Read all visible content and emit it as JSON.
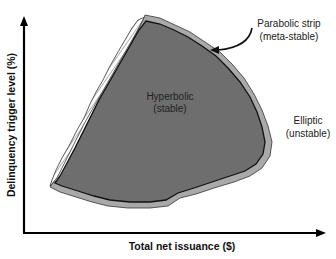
{
  "diagram": {
    "axes": {
      "x_label": "Total net issuance ($)",
      "y_label": "Delinquency trigger level (%)"
    },
    "regions": [
      {
        "id": "hyperbolic",
        "line1": "Hyperbolic",
        "line2": "(stable)",
        "color": "#6e6e6e"
      },
      {
        "id": "parabolic",
        "line1": "Parabolic strip",
        "line2": "(meta-stable)",
        "color": "#a9a9a9"
      },
      {
        "id": "elliptic",
        "line1": "Elliptic",
        "line2": "(unstable)",
        "color": "#ffffff"
      }
    ],
    "hatched_region": {
      "fill": "hatched",
      "stroke": "#333333"
    }
  }
}
